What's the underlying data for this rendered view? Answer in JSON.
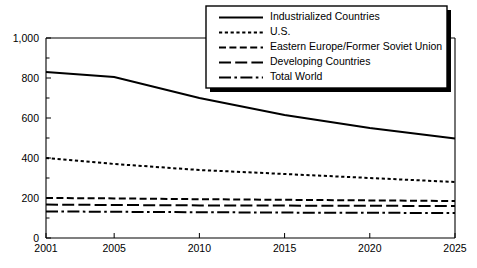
{
  "chart_data": {
    "type": "line",
    "title": "",
    "subtitle": "",
    "xlabel": "",
    "ylabel": "",
    "xlim": [
      2001,
      2025
    ],
    "ylim": [
      0,
      1000
    ],
    "grid": false,
    "legend_position": "top-right",
    "x": [
      2001,
      2005,
      2010,
      2015,
      2020,
      2025
    ],
    "xtick_labels": [
      "2001",
      "2005",
      "2010",
      "2015",
      "2020",
      "2025"
    ],
    "ytick_values": [
      0,
      200,
      400,
      600,
      800,
      1000
    ],
    "ytick_labels": [
      "0",
      "200",
      "400",
      "600",
      "800",
      "1,000"
    ],
    "series": [
      {
        "name": "Industrialized Countries",
        "dash": "solid",
        "values": [
          830,
          805,
          700,
          615,
          550,
          498
        ]
      },
      {
        "name": "U.S.",
        "dash": "dotted",
        "values": [
          400,
          370,
          340,
          320,
          300,
          280
        ]
      },
      {
        "name": "Eastern Europe/Former Soviet Union",
        "dash": "dashed",
        "values": [
          200,
          198,
          194,
          191,
          188,
          185
        ]
      },
      {
        "name": "Developing Countries",
        "dash": "long-dash",
        "values": [
          167,
          165,
          163,
          162,
          161,
          160
        ]
      },
      {
        "name": "Total World",
        "dash": "dash-dot",
        "values": [
          133,
          131,
          129,
          127,
          126,
          125
        ]
      }
    ]
  },
  "legend": {
    "entries": [
      {
        "label": "Industrialized Countries",
        "style": "solid"
      },
      {
        "label": "U.S.",
        "style": "dotted"
      },
      {
        "label": "Eastern Europe/Former Soviet Union",
        "style": "dashed"
      },
      {
        "label": "Developing Countries",
        "style": "long-dash"
      },
      {
        "label": "Total World",
        "style": "dash-dot"
      }
    ]
  },
  "colors": {
    "ink": "#000000",
    "background": "#ffffff"
  }
}
